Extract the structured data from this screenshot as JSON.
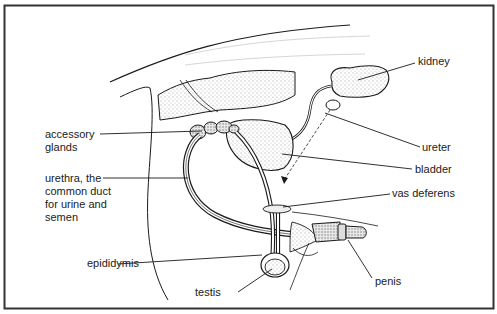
{
  "figure": {
    "frame_color": "#333333",
    "line_color": "#1a1a1a"
  },
  "labels": {
    "kidney": "kidney",
    "ureter": "ureter",
    "bladder": "bladder",
    "vas_deferens": "vas deferens",
    "penis": "penis",
    "testis": "testis",
    "epididymis": "epididymis",
    "accessory_glands": "accessory\nglands",
    "urethra": "urethra, the\ncommon duct\nfor urine and\nsemen"
  }
}
